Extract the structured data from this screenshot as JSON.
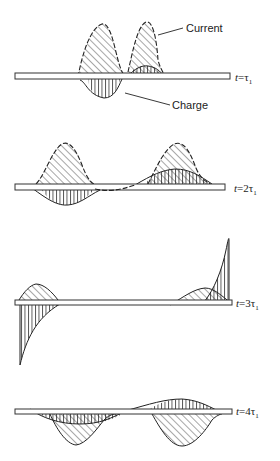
{
  "figure": {
    "annotations": {
      "current": "Current",
      "charge": "Charge"
    },
    "panels": [
      {
        "time_label": "t = τ₁",
        "t_prefix": "t",
        "eq": "=",
        "coef": "",
        "tau": "τ",
        "sub": "1"
      },
      {
        "time_label": "t = 2τ₁",
        "t_prefix": "t",
        "eq": "=",
        "coef": "2",
        "tau": "τ",
        "sub": "1"
      },
      {
        "time_label": "t = 3τ₁",
        "t_prefix": "t",
        "eq": "=",
        "coef": "3",
        "tau": "τ",
        "sub": "1"
      },
      {
        "time_label": "t = 4τ₁",
        "t_prefix": "t",
        "eq": "=",
        "coef": "4",
        "tau": "τ",
        "sub": "1"
      }
    ],
    "legend": {
      "current_fill": "diagonal hatching",
      "charge_fill": "vertical hatching"
    },
    "colors": {
      "ink": "#222222",
      "background": "#ffffff"
    }
  }
}
